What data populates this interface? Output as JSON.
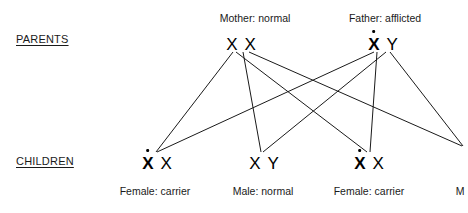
{
  "diagram": {
    "title_row_labels": {
      "parents": "PARENTS",
      "children": "CHILDREN"
    },
    "parents": [
      {
        "id": "mother",
        "caption": "Mother: normal",
        "caption_x": 255,
        "caption_y": 12,
        "genotype_x": 241,
        "genotype_y": 36,
        "alleles": [
          {
            "symbol": "X",
            "affected": false
          },
          {
            "symbol": "X",
            "affected": false
          }
        ]
      },
      {
        "id": "father",
        "caption": "Father: afflicted",
        "caption_x": 385,
        "caption_y": 12,
        "genotype_x": 383,
        "genotype_y": 36,
        "alleles": [
          {
            "symbol": "X",
            "affected": true
          },
          {
            "symbol": "Y",
            "affected": false
          }
        ]
      }
    ],
    "children": [
      {
        "id": "child-1",
        "caption": "Female: carrier",
        "caption_x": 155,
        "caption_y": 185,
        "genotype_x": 157,
        "genotype_y": 155,
        "alleles": [
          {
            "symbol": "X",
            "affected": true
          },
          {
            "symbol": "X",
            "affected": false
          }
        ]
      },
      {
        "id": "child-2",
        "caption": "Male: normal",
        "caption_x": 263,
        "caption_y": 185,
        "genotype_x": 264,
        "genotype_y": 155,
        "alleles": [
          {
            "symbol": "X",
            "affected": false
          },
          {
            "symbol": "Y",
            "affected": false
          }
        ]
      },
      {
        "id": "child-3",
        "caption": "Female: carrier",
        "caption_x": 369,
        "caption_y": 185,
        "genotype_x": 369,
        "genotype_y": 155,
        "alleles": [
          {
            "symbol": "X",
            "affected": true
          },
          {
            "symbol": "X",
            "affected": false
          }
        ]
      },
      {
        "id": "child-4",
        "caption": "M",
        "caption_x": 460,
        "caption_y": 185,
        "genotype_x": 470,
        "genotype_y": 155,
        "alleles": []
      }
    ],
    "lines": [
      {
        "id": "mother-x1-to-child-1",
        "x1": 233,
        "y1": 52,
        "x2": 156,
        "y2": 152
      },
      {
        "id": "mother-x1-to-child-3",
        "x1": 236,
        "y1": 52,
        "x2": 367,
        "y2": 152
      },
      {
        "id": "mother-x2-to-child-2",
        "x1": 243,
        "y1": 52,
        "x2": 261,
        "y2": 152
      },
      {
        "id": "mother-x2-to-child-4",
        "x1": 249,
        "y1": 52,
        "x2": 462,
        "y2": 146
      },
      {
        "id": "father-x-to-child-1",
        "x1": 374,
        "y1": 52,
        "x2": 157,
        "y2": 152
      },
      {
        "id": "father-x-to-child-3",
        "x1": 377,
        "y1": 52,
        "x2": 370,
        "y2": 152
      },
      {
        "id": "father-y-to-child-2",
        "x1": 386,
        "y1": 52,
        "x2": 263,
        "y2": 152
      },
      {
        "id": "father-y-to-child-4",
        "x1": 390,
        "y1": 52,
        "x2": 463,
        "y2": 146
      }
    ],
    "style": {
      "line_color": "#1a1a1a",
      "line_width": 1,
      "background": "#ffffff",
      "text_color": "#1a1a1a"
    }
  }
}
